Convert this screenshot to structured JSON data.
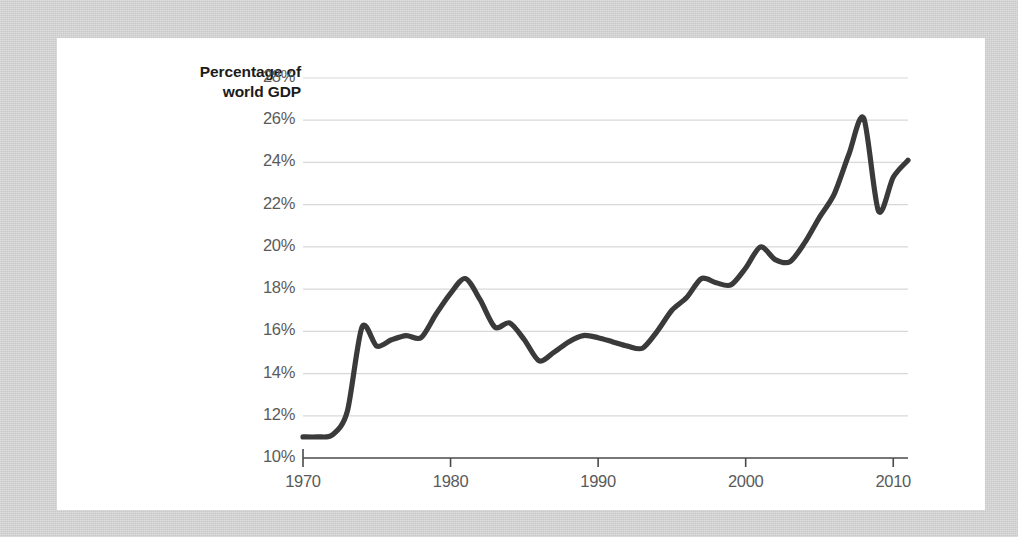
{
  "chart_data": {
    "type": "line",
    "title": "",
    "subtitle": "",
    "xlabel": "",
    "ylabel": "Percentage of world GDP",
    "ylabel_line1": "Percentage of",
    "ylabel_line2": "world GDP",
    "xlim": [
      1970,
      2011
    ],
    "ylim": [
      10,
      28
    ],
    "grid": "horizontal",
    "legend": "none",
    "line_color": "#3a3a3a",
    "gridline_color": "#d8d8d8",
    "axis_color": "#4a4a4a",
    "tick_label_color": "#5a5a5a",
    "axis_title_color": "#1b1b1b",
    "panel_background": "#ffffff",
    "page_background": "#d6d6d6",
    "yticks": [
      "10%",
      "12%",
      "14%",
      "16%",
      "18%",
      "20%",
      "22%",
      "24%",
      "26%",
      "28%"
    ],
    "ytick_values": [
      10,
      12,
      14,
      16,
      18,
      20,
      22,
      24,
      26,
      28
    ],
    "xticks": [
      "1970",
      "1980",
      "1990",
      "2000",
      "2010"
    ],
    "xtick_values": [
      1970,
      1980,
      1990,
      2000,
      2010
    ],
    "x": [
      1970,
      1971,
      1972,
      1973,
      1974,
      1975,
      1976,
      1977,
      1978,
      1979,
      1980,
      1981,
      1982,
      1983,
      1984,
      1985,
      1986,
      1987,
      1988,
      1989,
      1990,
      1991,
      1992,
      1993,
      1994,
      1995,
      1996,
      1997,
      1998,
      1999,
      2000,
      2001,
      2002,
      2003,
      2004,
      2005,
      2006,
      2007,
      2008,
      2009,
      2010,
      2011
    ],
    "values": [
      11.0,
      11.0,
      11.1,
      12.2,
      16.2,
      15.3,
      15.6,
      15.8,
      15.7,
      16.8,
      17.8,
      18.5,
      17.5,
      16.2,
      16.4,
      15.6,
      14.6,
      15.0,
      15.5,
      15.8,
      15.7,
      15.5,
      15.3,
      15.2,
      16.0,
      17.0,
      17.6,
      18.5,
      18.3,
      18.2,
      19.0,
      20.0,
      19.4,
      19.3,
      20.2,
      21.4,
      22.5,
      24.4,
      26.1,
      21.7,
      23.3,
      24.1
    ],
    "series": [
      {
        "name": "Percentage of world GDP",
        "values": [
          11.0,
          11.0,
          11.1,
          12.2,
          16.2,
          15.3,
          15.6,
          15.8,
          15.7,
          16.8,
          17.8,
          18.5,
          17.5,
          16.2,
          16.4,
          15.6,
          14.6,
          15.0,
          15.5,
          15.8,
          15.7,
          15.5,
          15.3,
          15.2,
          16.0,
          17.0,
          17.6,
          18.5,
          18.3,
          18.2,
          19.0,
          20.0,
          19.4,
          19.3,
          20.2,
          21.4,
          22.5,
          24.4,
          26.1,
          21.7,
          23.3,
          24.1
        ]
      }
    ],
    "annotations": []
  }
}
